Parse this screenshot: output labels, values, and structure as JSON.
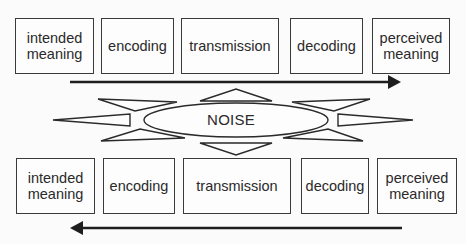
{
  "diagram": {
    "type": "communication-model",
    "top_row": {
      "direction": "left-to-right",
      "boxes": [
        {
          "label": "intended\nmeaning"
        },
        {
          "label": "encoding"
        },
        {
          "label": "transmission"
        },
        {
          "label": "decoding"
        },
        {
          "label": "perceived\nmeaning"
        }
      ]
    },
    "noise": {
      "label": "NOISE"
    },
    "bottom_row": {
      "direction": "right-to-left",
      "boxes": [
        {
          "label": "intended\nmeaning"
        },
        {
          "label": "encoding"
        },
        {
          "label": "transmission"
        },
        {
          "label": "decoding"
        },
        {
          "label": "perceived\nmeaning"
        }
      ]
    },
    "colors": {
      "stroke": "#2a2a2a",
      "background": "#fbfbfb"
    }
  }
}
